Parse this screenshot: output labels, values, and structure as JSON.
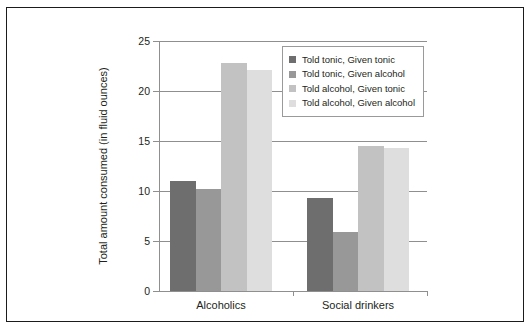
{
  "chart_data": {
    "type": "bar",
    "title": "",
    "subtitle": "",
    "xlabel": "",
    "ylabel": "Total amount consumed (in fluid ounces)",
    "categories": [
      "Alcoholics",
      "Social drinkers"
    ],
    "series": [
      {
        "name": "Told tonic, Given tonic",
        "color": "#6e6e6e",
        "values": [
          11.0,
          9.3
        ]
      },
      {
        "name": "Told tonic, Given alcohol",
        "color": "#989898",
        "values": [
          10.2,
          5.9
        ]
      },
      {
        "name": "Told alcohol, Given tonic",
        "color": "#c2c2c2",
        "values": [
          22.8,
          14.5
        ]
      },
      {
        "name": "Told alcohol, Given alcohol",
        "color": "#dedede",
        "values": [
          22.1,
          14.3
        ]
      }
    ],
    "ylim": [
      0,
      25
    ],
    "yticks": [
      0,
      5,
      10,
      15,
      20,
      25
    ],
    "ytick_labels": [
      "0",
      "5",
      "10",
      "15",
      "20",
      "25"
    ],
    "grid": true,
    "legend_position": "top-right",
    "frame_color": "#1b1b1b",
    "axis_color": "#8f8f8f",
    "text_color": "#231f20",
    "background": "#ffffff"
  }
}
